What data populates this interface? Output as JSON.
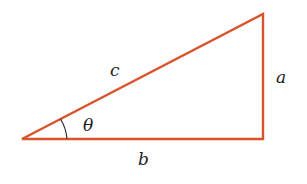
{
  "diagram": {
    "type": "right-triangle",
    "stroke_color": "#d9532b",
    "angle_arc_color": "#333333",
    "label_color": "#222222",
    "vertices": {
      "left": [
        22,
        139
      ],
      "top_right": [
        263,
        14
      ],
      "bottom_right": [
        263,
        139
      ]
    },
    "labels": {
      "hypotenuse": "c",
      "opposite": "a",
      "adjacent": "b",
      "angle": "θ"
    }
  }
}
